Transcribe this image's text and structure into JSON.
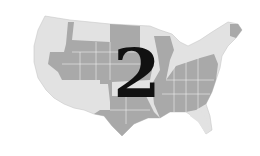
{
  "map": {
    "subject": "Contiguous United States",
    "style": "grayscale halftone",
    "numeral": "2",
    "colors": {
      "background": "#ffffff",
      "light_region": "#e2e2e2",
      "dark_region": "#a9a9a9",
      "border": "#f4f4f4",
      "numeral": "#111111"
    },
    "dark_regions": [
      "Idaho",
      "Montana",
      "Wyoming",
      "Nevada",
      "Utah",
      "Colorado",
      "South Dakota",
      "Nebraska",
      "Kansas",
      "Oklahoma",
      "Texas",
      "Iowa",
      "Missouri",
      "Arkansas",
      "Louisiana",
      "Wisconsin",
      "Indiana",
      "Ohio",
      "Kentucky",
      "Tennessee",
      "Mississippi",
      "Alabama",
      "Georgia",
      "South Carolina",
      "North Carolina",
      "Virginia",
      "West Virginia",
      "Pennsylvania",
      "Maryland",
      "Maine"
    ],
    "light_regions": [
      "Washington",
      "Oregon",
      "California",
      "Arizona",
      "New Mexico",
      "North Dakota",
      "Minnesota",
      "Illinois",
      "Michigan",
      "Florida",
      "New York",
      "Vermont",
      "New Hampshire"
    ]
  }
}
